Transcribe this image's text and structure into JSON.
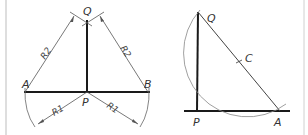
{
  "figures": [
    {
      "id": "perpendicular-from-point-on-line",
      "points": {
        "A": {
          "label": "A",
          "x": 25,
          "y": 92
        },
        "B": {
          "label": "B",
          "x": 148,
          "y": 92
        },
        "P": {
          "label": "P",
          "x": 87,
          "y": 92
        },
        "Q": {
          "label": "Q",
          "x": 87,
          "y": 20
        }
      },
      "dimensions": {
        "r2_left": "R2",
        "r2_right": "R2",
        "r1_left": "R1",
        "r1_right": "R1"
      }
    },
    {
      "id": "perpendicular-at-end-of-line",
      "points": {
        "Q": {
          "label": "Q",
          "x": 198,
          "y": 12
        },
        "P": {
          "label": "P",
          "x": 197,
          "y": 111
        },
        "A": {
          "label": "A",
          "x": 280,
          "y": 111
        },
        "C": {
          "label": "C",
          "x": 239,
          "y": 62
        }
      }
    }
  ],
  "colors": {
    "thick_line": "#1a1a1a",
    "thin_line": "#555555",
    "arc": "#888888",
    "frame": "#bdbdbd"
  }
}
